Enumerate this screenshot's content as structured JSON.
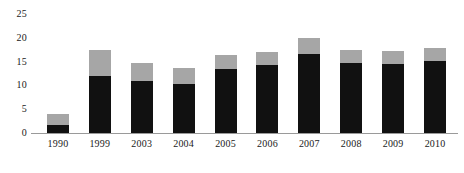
{
  "chart_data": {
    "type": "bar",
    "title": "",
    "subtitle": "",
    "xlabel": "",
    "ylabel": "",
    "stacked": true,
    "grid": false,
    "legend_position": "none",
    "ylim": [
      0,
      25
    ],
    "yticks": [
      0,
      5,
      10,
      15,
      20,
      25
    ],
    "ytick_labels": [
      "0",
      "5",
      "10",
      "15",
      "20",
      "25"
    ],
    "categories": [
      "1990",
      "1999",
      "2003",
      "2004",
      "2005",
      "2006",
      "2007",
      "2008",
      "2009",
      "2010"
    ],
    "series": [
      {
        "name": "lower-segment",
        "color": "#111111",
        "values": [
          1.6,
          12.0,
          10.9,
          10.3,
          13.4,
          14.3,
          16.6,
          14.7,
          14.4,
          15.2
        ]
      },
      {
        "name": "upper-segment",
        "color": "#a6a6a6",
        "values": [
          2.4,
          5.4,
          3.8,
          3.4,
          3.0,
          2.8,
          3.4,
          2.7,
          2.8,
          2.7
        ]
      }
    ],
    "totals": [
      4.0,
      17.4,
      14.7,
      13.7,
      16.4,
      17.1,
      20.0,
      17.4,
      17.2,
      17.9
    ]
  },
  "colors": {
    "lower": "#111111",
    "upper": "#a6a6a6",
    "axis": "#9a9a9a",
    "text": "#1a1a1a",
    "background": "#ffffff"
  }
}
